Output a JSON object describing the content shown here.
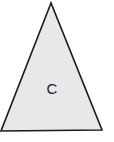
{
  "diagram": {
    "shape": "triangle",
    "label": "C",
    "fill_color": "#e8e8e8",
    "stroke_color": "#1a1a1a",
    "background_color": "#ffffff",
    "vertices": {
      "apex": [
        51,
        3
      ],
      "bottom_left": [
        1,
        131
      ],
      "bottom_right": [
        102,
        130
      ]
    }
  }
}
